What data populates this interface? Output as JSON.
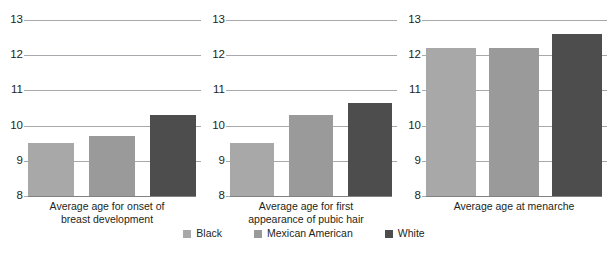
{
  "chart_data": {
    "type": "bar",
    "title": "",
    "subtitle": "",
    "xlabel": "",
    "ylabel": "",
    "ylim": [
      8,
      13
    ],
    "yticks": [
      8,
      9,
      10,
      11,
      12,
      13
    ],
    "ytick_labels": [
      "8",
      "9",
      "10",
      "11",
      "12",
      "13"
    ],
    "grid": true,
    "legend_position": "bottom-center",
    "categories": [
      "Average age for onset of breast development",
      "Average age for first appearance of pubic hair",
      "Average age at menarche"
    ],
    "series": [
      {
        "name": "Black",
        "color": "#a8a8a8",
        "values": [
          9.5,
          9.5,
          12.2
        ]
      },
      {
        "name": "Mexican American",
        "color": "#9a9a9a",
        "values": [
          9.7,
          10.3,
          12.2
        ]
      },
      {
        "name": "White",
        "color": "#4d4d4d",
        "values": [
          10.3,
          10.65,
          12.6
        ]
      }
    ],
    "panels": [
      {
        "caption_line1": "Average age for onset of",
        "caption_line2": "breast development",
        "bars": [
          {
            "series": "Black",
            "value": 9.5
          },
          {
            "series": "Mexican American",
            "value": 9.7
          },
          {
            "series": "White",
            "value": 10.3
          }
        ]
      },
      {
        "caption_line1": "Average age for first",
        "caption_line2": "appearance of pubic hair",
        "bars": [
          {
            "series": "Black",
            "value": 9.5
          },
          {
            "series": "Mexican American",
            "value": 10.3
          },
          {
            "series": "White",
            "value": 10.65
          }
        ]
      },
      {
        "caption_line1": "Average age at menarche",
        "caption_line2": "",
        "bars": [
          {
            "series": "Black",
            "value": 12.2
          },
          {
            "series": "Mexican American",
            "value": 12.2
          },
          {
            "series": "White",
            "value": 12.6
          }
        ]
      }
    ]
  },
  "legend": {
    "items": [
      {
        "label": "Black",
        "color": "#a8a8a8"
      },
      {
        "label": "Mexican American",
        "color": "#9a9a9a"
      },
      {
        "label": "White",
        "color": "#4d4d4d"
      }
    ]
  },
  "colors": {
    "gridline": "#a7a9ac",
    "baseline": "#808285",
    "text": "#231f20",
    "background": "#ffffff"
  }
}
